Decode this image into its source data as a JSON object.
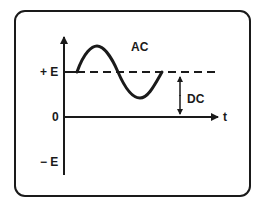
{
  "diagram": {
    "labels": {
      "ac": "AC",
      "dc": "DC",
      "time_axis": "t",
      "plus_e": "+ E",
      "zero": "0",
      "minus_e": "− E"
    },
    "colors": {
      "ink": "#1a1a1a",
      "background": "#ffffff"
    }
  }
}
